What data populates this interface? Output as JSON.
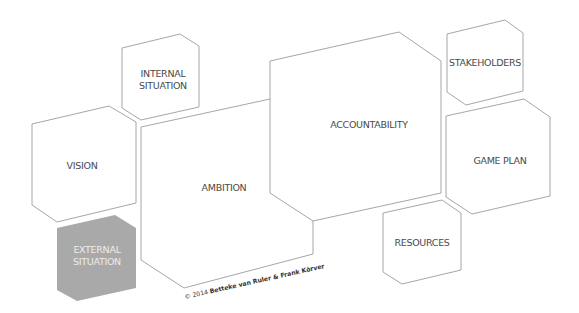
{
  "diagram": {
    "line_color": "#a6a6a6",
    "text_color": "#4a4a4a",
    "shapes": [
      {
        "id": "internal-situation",
        "lines": [
          "INTERNAL",
          "SITUATION"
        ],
        "points": "122,48 180,34 199,46 199,107 141,120 122,108",
        "fill": "#ffffff",
        "text_x": 163,
        "text_y": 77
      },
      {
        "id": "vision",
        "lines": [
          "VISION"
        ],
        "points": "32,124 109,106 136,122 136,203 57,222 32,205",
        "fill": "#ffffff",
        "text_x": 82,
        "text_y": 169
      },
      {
        "id": "ambition",
        "lines": [
          "AMBITION"
        ],
        "points": "141,127 270,99 313,128 313,254 184,288 141,260",
        "fill": "#ffffff",
        "text_x": 224,
        "text_y": 191
      },
      {
        "id": "accountability",
        "lines": [
          "ACCOUNTABILITY"
        ],
        "points": "270,61 399,32 441,61 441,193 313,221 270,193",
        "fill": "#ffffff",
        "text_x": 369,
        "text_y": 128
      },
      {
        "id": "stakeholders",
        "lines": [
          "STAKEHOLDERS"
        ],
        "points": "447,34 505,20 523,33 523,91 466,105 447,92",
        "fill": "#ffffff",
        "text_x": 485,
        "text_y": 66
      },
      {
        "id": "game-plan",
        "lines": [
          "GAME PLAN"
        ],
        "points": "446,116 524,99 550,117 550,196 472,214 446,197",
        "fill": "#ffffff",
        "text_x": 500,
        "text_y": 164
      },
      {
        "id": "resources",
        "lines": [
          "RESOURCES"
        ],
        "points": "383,213 442,200 461,213 461,270 402,284 383,272",
        "fill": "#ffffff",
        "text_x": 422,
        "text_y": 246
      },
      {
        "id": "external-situation",
        "lines": [
          "EXTERNAL",
          "SITUATION"
        ],
        "points": "57,228 115,215 136,228 136,288 77,301 57,290",
        "fill": "#a9a9a9",
        "text_x": 97,
        "text_y": 253
      }
    ],
    "copyright": {
      "prefix": "© 2014 ",
      "authors": "Betteke van Ruler & Frank Körver"
    }
  }
}
